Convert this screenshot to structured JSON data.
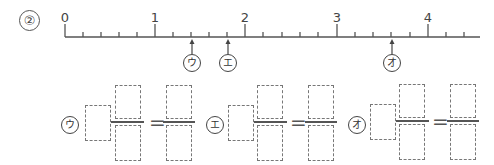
{
  "problem": {
    "number": "②"
  },
  "number_line": {
    "min": 0,
    "max": 4.5,
    "subdivisions_per_unit": 5,
    "labels": [
      {
        "value": "0",
        "x": 65
      },
      {
        "value": "1",
        "x": 155
      },
      {
        "value": "2",
        "x": 245
      },
      {
        "value": "3",
        "x": 337
      },
      {
        "value": "4",
        "x": 428
      }
    ],
    "marks": [
      {
        "label": "ウ",
        "value": 1.4,
        "x": 192
      },
      {
        "label": "エ",
        "value": 1.8,
        "x": 228
      },
      {
        "label": "オ",
        "value": 3.6,
        "x": 392
      }
    ]
  },
  "answer_groups": [
    {
      "label": "ウ",
      "whole": "",
      "numerator": "",
      "denominator": "",
      "equals": "=",
      "improper_numerator": "",
      "improper_denominator": ""
    },
    {
      "label": "エ",
      "whole": "",
      "numerator": "",
      "denominator": "",
      "equals": "=",
      "improper_numerator": "",
      "improper_denominator": ""
    },
    {
      "label": "オ",
      "whole": "",
      "numerator": "",
      "denominator": "",
      "equals": "=",
      "improper_numerator": "",
      "improper_denominator": ""
    }
  ]
}
